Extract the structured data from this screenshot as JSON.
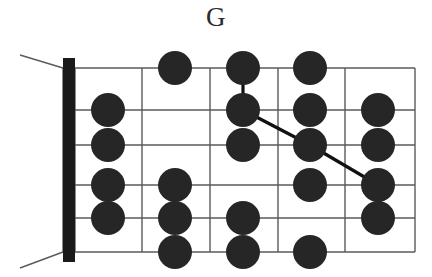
{
  "title": "G",
  "diagram": {
    "type": "guitar-fretboard-scale-diagram",
    "instrument": "guitar",
    "strings": 6,
    "frets": 5,
    "nut_shown": true,
    "colors": {
      "dot": "#262626",
      "grid": "#5a5a5a",
      "nut": "#1a1a1a",
      "title": "#2b2b2b",
      "connector": "#111111",
      "background": "#ffffff"
    },
    "geometry": {
      "left": 75,
      "right": 415,
      "top": 68,
      "bottom": 252,
      "nut_x": 63,
      "nut_width": 12,
      "fret_x": [
        75,
        142,
        210,
        278,
        345,
        415
      ],
      "string_y": [
        68,
        110,
        145,
        185,
        218,
        252
      ],
      "dot_x": [
        108,
        175,
        243,
        310,
        378
      ],
      "dot_radius": 17
    },
    "string_labels": [
      "1 (high E)",
      "2 (B)",
      "3 (G)",
      "4 (D)",
      "5 (A)",
      "6 (low E)"
    ],
    "fret_labels": [
      "1",
      "2",
      "3",
      "4",
      "5"
    ],
    "dots": [
      {
        "fret": 2,
        "string": 1
      },
      {
        "fret": 3,
        "string": 1
      },
      {
        "fret": 4,
        "string": 1
      },
      {
        "fret": 1,
        "string": 2
      },
      {
        "fret": 3,
        "string": 2
      },
      {
        "fret": 4,
        "string": 2
      },
      {
        "fret": 5,
        "string": 2
      },
      {
        "fret": 1,
        "string": 3
      },
      {
        "fret": 3,
        "string": 3
      },
      {
        "fret": 4,
        "string": 3
      },
      {
        "fret": 5,
        "string": 3
      },
      {
        "fret": 1,
        "string": 4
      },
      {
        "fret": 2,
        "string": 4
      },
      {
        "fret": 4,
        "string": 4
      },
      {
        "fret": 5,
        "string": 4
      },
      {
        "fret": 1,
        "string": 5
      },
      {
        "fret": 2,
        "string": 5
      },
      {
        "fret": 3,
        "string": 5
      },
      {
        "fret": 5,
        "string": 5
      },
      {
        "fret": 2,
        "string": 6
      },
      {
        "fret": 3,
        "string": 6
      },
      {
        "fret": 4,
        "string": 6
      }
    ],
    "connectors": [
      {
        "from": {
          "fret": 3,
          "string": 1
        },
        "to": {
          "fret": 3,
          "string": 2
        }
      },
      {
        "from": {
          "fret": 3,
          "string": 2
        },
        "to": {
          "fret": 4,
          "string": 3
        }
      },
      {
        "from": {
          "fret": 4,
          "string": 3
        },
        "to": {
          "fret": 5,
          "string": 4
        }
      }
    ],
    "headstock_edges": [
      {
        "x1": 20,
        "y1": 55,
        "x2": 63,
        "y2": 68
      },
      {
        "x1": 20,
        "y1": 268,
        "x2": 63,
        "y2": 252
      }
    ]
  }
}
